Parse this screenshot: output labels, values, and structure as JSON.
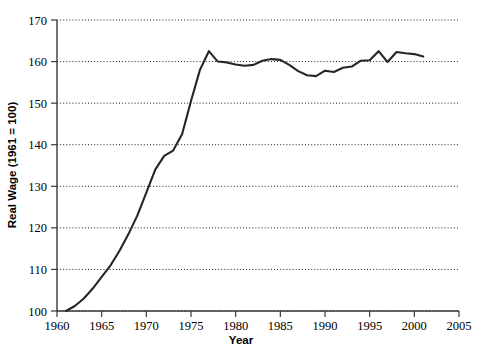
{
  "chart_data": {
    "type": "line",
    "title": "",
    "xlabel": "Year",
    "ylabel": "Real Wage (1961 = 100)",
    "xlim": [
      1960,
      2005
    ],
    "ylim": [
      100,
      170
    ],
    "grid": true,
    "grid_axis": "y",
    "legend": false,
    "legend_position": "none",
    "line_color": "#262626",
    "xticks": [
      1960,
      1965,
      1970,
      1975,
      1980,
      1985,
      1990,
      1995,
      2000,
      2005
    ],
    "xtick_labels": [
      "1960",
      "1965",
      "1970",
      "1975",
      "1980",
      "1985",
      "1990",
      "1995",
      "2000",
      "2005"
    ],
    "yticks": [
      100,
      110,
      120,
      130,
      140,
      150,
      160,
      170
    ],
    "ytick_labels": [
      "100",
      "110",
      "120",
      "130",
      "140",
      "150",
      "160",
      "170"
    ],
    "x": [
      1961,
      1962,
      1963,
      1964,
      1965,
      1966,
      1967,
      1968,
      1969,
      1970,
      1971,
      1972,
      1973,
      1974,
      1975,
      1976,
      1977,
      1978,
      1979,
      1980,
      1981,
      1982,
      1983,
      1984,
      1985,
      1986,
      1987,
      1988,
      1989,
      1990,
      1991,
      1992,
      1993,
      1994,
      1995,
      1996,
      1997,
      1998,
      1999,
      2000,
      2001
    ],
    "values": [
      100.0,
      101.2,
      103.0,
      105.4,
      108.2,
      111.0,
      114.5,
      118.5,
      123.0,
      128.5,
      134.0,
      137.3,
      138.6,
      142.5,
      150.5,
      158.0,
      162.5,
      160.0,
      159.8,
      159.3,
      159.0,
      159.2,
      160.2,
      160.6,
      160.4,
      159.2,
      157.7,
      156.7,
      156.5,
      157.8,
      157.5,
      158.5,
      158.8,
      160.2,
      160.3,
      162.5,
      159.9,
      162.3,
      162.0,
      161.8,
      161.2
    ],
    "series": [
      {
        "name": "Real Wage Index",
        "values": [
          100.0,
          101.2,
          103.0,
          105.4,
          108.2,
          111.0,
          114.5,
          118.5,
          123.0,
          128.5,
          134.0,
          137.3,
          138.6,
          142.5,
          150.5,
          158.0,
          162.5,
          160.0,
          159.8,
          159.3,
          159.0,
          159.2,
          160.2,
          160.6,
          160.4,
          159.2,
          157.7,
          156.7,
          156.5,
          157.8,
          157.5,
          158.5,
          158.8,
          160.2,
          160.3,
          162.5,
          159.9,
          162.3,
          162.0,
          161.8,
          161.2
        ]
      }
    ]
  }
}
